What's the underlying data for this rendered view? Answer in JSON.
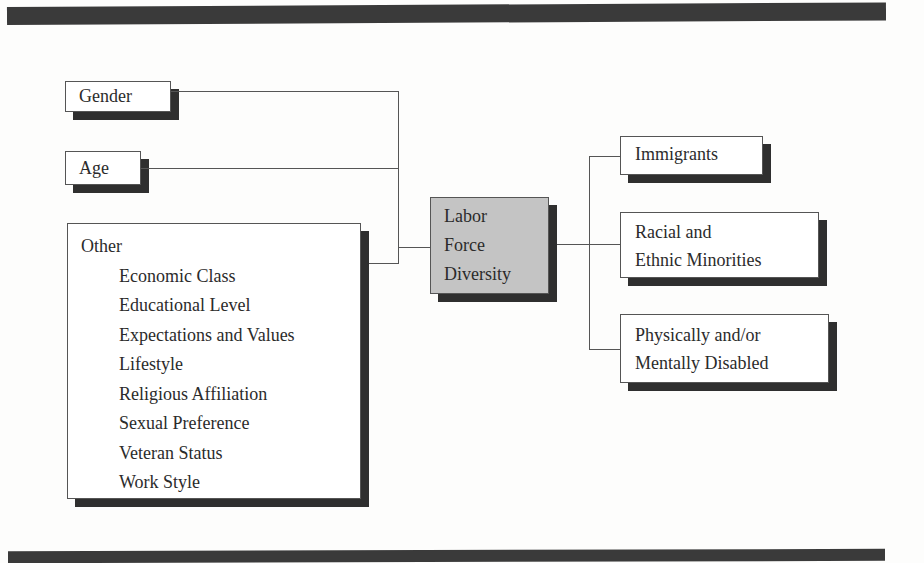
{
  "diagram": {
    "title": "Labor Force Diversity",
    "center": {
      "lines": [
        "Labor",
        "Force",
        "Diversity"
      ],
      "fill": "#c4c4c4"
    },
    "left": {
      "gender": "Gender",
      "age": "Age",
      "other": {
        "heading": "Other",
        "items": [
          "Economic Class",
          "Educational Level",
          "Expectations and Values",
          "Lifestyle",
          "Religious Affiliation",
          "Sexual Preference",
          "Veteran Status",
          "Work Style"
        ]
      }
    },
    "right": {
      "immigrants": "Immigrants",
      "racial": [
        "Racial and",
        "Ethnic Minorities"
      ],
      "disabled": [
        "Physically and/or",
        "Mentally Disabled"
      ]
    },
    "colors": {
      "bar": "#3a3a3a",
      "shadow": "#2f2f2f",
      "line": "#555555",
      "center_fill": "#c4c4c4"
    }
  }
}
